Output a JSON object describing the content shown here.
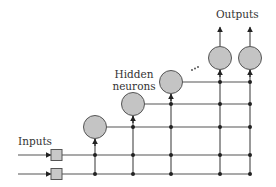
{
  "diagram": {
    "type": "cascade-correlation neural network",
    "labels": {
      "inputs": "Inputs",
      "hidden": [
        "Hidden",
        "neurons"
      ],
      "outputs": "Outputs",
      "ellipsis": "..."
    },
    "colors": {
      "line": "#555555",
      "node_fill": "#c4c4c4",
      "node_stroke": "#555555",
      "square_fill": "#c8c8c8",
      "dot": "#222222",
      "text": "#333333"
    },
    "inputs": [
      {
        "name": "input-1",
        "y": 155
      },
      {
        "name": "input-2",
        "y": 174
      }
    ],
    "hidden_neurons": [
      {
        "name": "hidden-neuron-1",
        "cx": 95,
        "cy": 127
      },
      {
        "name": "hidden-neuron-2",
        "cx": 133,
        "cy": 104
      },
      {
        "name": "hidden-neuron-3",
        "cx": 171,
        "cy": 82
      }
    ],
    "output_neurons": [
      {
        "name": "output-neuron-1",
        "cx": 220,
        "cy": 58
      },
      {
        "name": "output-neuron-2",
        "cx": 250,
        "cy": 58
      }
    ]
  }
}
